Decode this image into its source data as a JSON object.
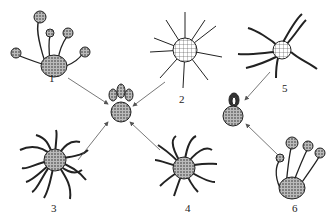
{
  "figure": {
    "labels": [
      {
        "id": "1",
        "text": "1",
        "x": 51,
        "y": 73
      },
      {
        "id": "2",
        "text": "2",
        "x": 178,
        "y": 93
      },
      {
        "id": "3",
        "text": "3",
        "x": 51,
        "y": 203
      },
      {
        "id": "4",
        "text": "4",
        "x": 185,
        "y": 203
      },
      {
        "id": "5",
        "text": "5",
        "x": 283,
        "y": 83
      },
      {
        "id": "6",
        "text": "6",
        "x": 292,
        "y": 203
      }
    ],
    "center_left": {
      "name": "spore-cluster",
      "x": 121,
      "y": 113
    },
    "center_right": {
      "name": "spore-cluster",
      "x": 233,
      "y": 112
    },
    "colors": {
      "ink": "#222222",
      "stipple": "#555555",
      "arrow": "#555555"
    }
  }
}
